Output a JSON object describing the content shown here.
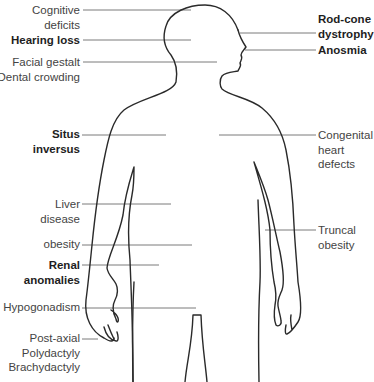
{
  "diagram": {
    "type": "annotated-body-outline",
    "colors": {
      "outline": "#2a2a2a",
      "leader_line": "#7a7a7a",
      "text": "#444444",
      "bold_text": "#1e1e1e",
      "background": "#ffffff"
    },
    "left_labels": [
      {
        "id": "cognitive",
        "lines": [
          "Cognitive",
          "deficits"
        ],
        "bold": false
      },
      {
        "id": "hearing",
        "lines": [
          "Hearing loss"
        ],
        "bold": true
      },
      {
        "id": "facial",
        "lines": [
          "Facial gestalt",
          "Dental crowding"
        ],
        "bold": false
      },
      {
        "id": "situs",
        "lines": [
          "Situs",
          "inversus"
        ],
        "bold": true
      },
      {
        "id": "liver",
        "lines": [
          "Liver",
          "disease"
        ],
        "bold": false
      },
      {
        "id": "obesity",
        "lines": [
          "obesity"
        ],
        "bold": false
      },
      {
        "id": "renal",
        "lines": [
          "Renal",
          "anomalies"
        ],
        "bold": true
      },
      {
        "id": "hypogonadism",
        "lines": [
          "Hypogonadism"
        ],
        "bold": false
      },
      {
        "id": "polydactyly",
        "lines": [
          "Post-axial",
          "Polydactyly",
          "Brachydactyly"
        ],
        "bold": false
      }
    ],
    "right_labels": [
      {
        "id": "rodcone",
        "lines": [
          "Rod-cone",
          "dystrophy"
        ],
        "bold": true
      },
      {
        "id": "anosmia",
        "lines": [
          "Anosmia"
        ],
        "bold": true
      },
      {
        "id": "heart",
        "lines": [
          "Congenital",
          "heart",
          "defects"
        ],
        "bold": false
      },
      {
        "id": "truncal",
        "lines": [
          "Truncal",
          "obesity"
        ],
        "bold": false
      }
    ]
  }
}
